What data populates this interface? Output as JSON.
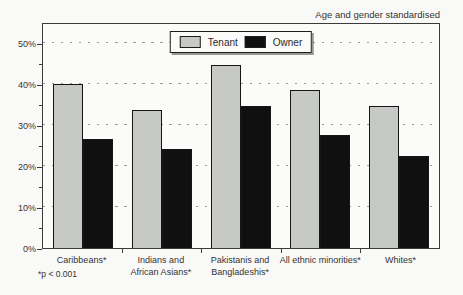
{
  "figure": {
    "annotation_top_right": "Age and gender standardised",
    "footnote": "*p < 0.001"
  },
  "legend": {
    "position": "top-center",
    "items": [
      {
        "label": "Tenant",
        "color": "#c7c9c6"
      },
      {
        "label": "Owner",
        "color": "#101010"
      }
    ]
  },
  "chart_data": {
    "type": "bar",
    "title": "",
    "xlabel": "",
    "ylabel": "",
    "categories": [
      "Caribbeans*",
      "Indians and African Asians*",
      "Pakistanis and Bangladeshis*",
      "All ethnic minorities*",
      "Whites*"
    ],
    "x_label_lines": [
      [
        "Caribbeans*"
      ],
      [
        "Indians and",
        "African Asians*"
      ],
      [
        "Pakistanis and",
        "Bangladeshis*"
      ],
      [
        "All ethnic minorities*"
      ],
      [
        "Whites*"
      ]
    ],
    "series": [
      {
        "name": "Tenant",
        "color": "#c7c9c6",
        "values": [
          40,
          33.5,
          44.5,
          38.5,
          34.5
        ]
      },
      {
        "name": "Owner",
        "color": "#101010",
        "values": [
          26.5,
          24,
          34.5,
          27.5,
          22.5
        ]
      }
    ],
    "ylim": [
      0,
      55
    ],
    "yticks": [
      {
        "value": 0,
        "label": "0%"
      },
      {
        "value": 10,
        "label": "10%"
      },
      {
        "value": 20,
        "label": "20%"
      },
      {
        "value": 30,
        "label": "30%"
      },
      {
        "value": 40,
        "label": "40%"
      },
      {
        "value": 50,
        "label": "50%"
      }
    ],
    "ytick_minor_step": 5,
    "grid": "dashed horizontal at major ticks",
    "legend_position": "top-center",
    "annotation": "Age and gender standardised",
    "footnote": "*p < 0.001"
  }
}
